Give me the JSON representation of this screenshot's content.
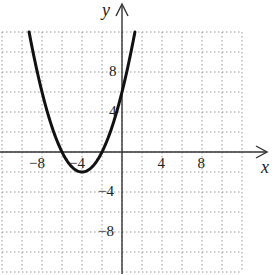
{
  "chart_data": {
    "type": "line",
    "title": "",
    "xlabel": "x",
    "ylabel": "y",
    "xlim": [
      -12,
      12
    ],
    "ylim": [
      -12,
      12
    ],
    "grid": true,
    "grid_step": 2,
    "grid_style": "dotted",
    "legend": null,
    "x_tick_labels": [
      {
        "value": -8,
        "label": "−8"
      },
      {
        "value": -4,
        "label": "−4"
      },
      {
        "value": 4,
        "label": "4"
      },
      {
        "value": 8,
        "label": "8"
      }
    ],
    "y_tick_labels": [
      {
        "value": 8,
        "label": "8"
      },
      {
        "value": 4,
        "label": "4"
      },
      {
        "value": -4,
        "label": "−4"
      },
      {
        "value": -8,
        "label": "−8"
      }
    ],
    "series": [
      {
        "name": "parabola",
        "equation": "y = 0.5(x + 4)^2 - 2",
        "vertex": [
          -4,
          -2
        ],
        "x_intercepts": [
          -6,
          -2
        ],
        "y_intercept": 6,
        "x": [
          -9.29,
          -9,
          -8,
          -7,
          -6,
          -5,
          -4,
          -3,
          -2,
          -1,
          0,
          1
        ],
        "values": [
          12,
          10.5,
          6,
          2.5,
          0,
          -1.5,
          -2,
          -1.5,
          0,
          2.5,
          6,
          10.5
        ]
      }
    ],
    "colors": {
      "curve": "#111111",
      "axes": "#333333",
      "grid": "#9a9a9a"
    }
  }
}
